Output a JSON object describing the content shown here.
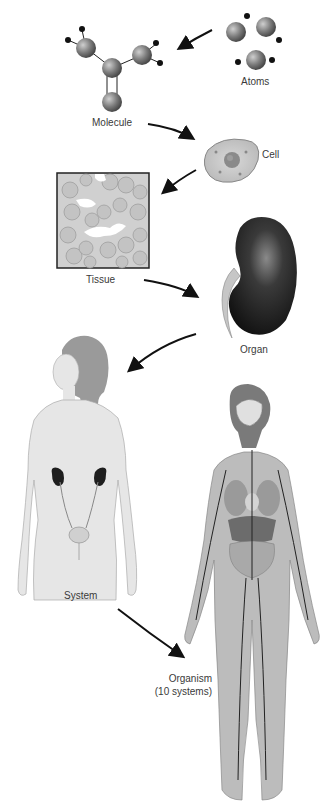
{
  "levels": [
    {
      "id": "atoms",
      "label": "Atoms"
    },
    {
      "id": "molecule",
      "label": "Molecule"
    },
    {
      "id": "cell",
      "label": "Cell"
    },
    {
      "id": "tissue",
      "label": "Tissue"
    },
    {
      "id": "organ",
      "label": "Organ"
    },
    {
      "id": "system",
      "label": "System"
    },
    {
      "id": "organism",
      "label": "Organism",
      "sublabel": "(10 systems)"
    }
  ],
  "flow": [
    "Atoms",
    "Molecule",
    "Cell",
    "Tissue",
    "Organ",
    "System",
    "Organism"
  ],
  "colors": {
    "background": "#ffffff",
    "ink": "#111111",
    "atom": "#7a7a7a",
    "skin": "#e4e4e4",
    "organ": "#222222"
  }
}
